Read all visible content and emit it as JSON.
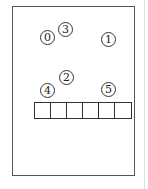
{
  "diagram": {
    "frame": {
      "stroke": "#555555"
    },
    "circles": [
      {
        "label": "0",
        "x": 40,
        "y": 30
      },
      {
        "label": "3",
        "x": 58,
        "y": 22
      },
      {
        "label": "1",
        "x": 101,
        "y": 32
      },
      {
        "label": "2",
        "x": 59,
        "y": 70
      },
      {
        "label": "4",
        "x": 40,
        "y": 83
      },
      {
        "label": "5",
        "x": 101,
        "y": 82
      }
    ],
    "cells": {
      "count": 6
    }
  }
}
